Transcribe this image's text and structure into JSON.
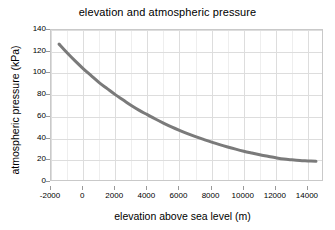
{
  "chart_data": {
    "type": "line",
    "title": "elevation and atmospheric pressure",
    "xlabel": "elevation above sea level (m)",
    "ylabel": "atmospheric pressure (kPa)",
    "xlim": [
      -2000,
      15000
    ],
    "ylim": [
      0,
      140
    ],
    "xticks": [
      -2000,
      0,
      2000,
      4000,
      6000,
      8000,
      10000,
      12000,
      14000
    ],
    "xtick_labels": [
      "-2000",
      "0",
      "2000",
      "4000",
      "6000",
      "8000",
      "10000",
      "12000",
      "14000"
    ],
    "yticks": [
      0,
      20,
      40,
      60,
      80,
      100,
      120,
      140
    ],
    "ytick_labels": [
      "0",
      "20",
      "40",
      "60",
      "80",
      "100",
      "120",
      "140"
    ],
    "grid": true,
    "grid_minor_x_step": 1000,
    "legend": null,
    "line_color": "#7a7a7a",
    "line_width": 3,
    "x": [
      -1500,
      -1000,
      -500,
      0,
      500,
      1000,
      1500,
      2000,
      2500,
      3000,
      3500,
      4000,
      4500,
      5000,
      5500,
      6000,
      6500,
      7000,
      7500,
      8000,
      8500,
      9000,
      9500,
      10000,
      10500,
      11000,
      11500,
      12000,
      12500,
      13000,
      13500,
      14000,
      14500
    ],
    "y": [
      127.0,
      119.0,
      111.5,
      104.5,
      98.0,
      91.5,
      86.0,
      80.5,
      75.5,
      70.5,
      66.0,
      62.0,
      58.0,
      54.3,
      50.8,
      47.6,
      44.6,
      41.8,
      39.2,
      36.7,
      34.4,
      32.3,
      30.3,
      28.4,
      26.7,
      25.1,
      23.7,
      22.3,
      21.1,
      20.4,
      19.8,
      19.4,
      19.0
    ],
    "series_name": "atmospheric pressure"
  }
}
